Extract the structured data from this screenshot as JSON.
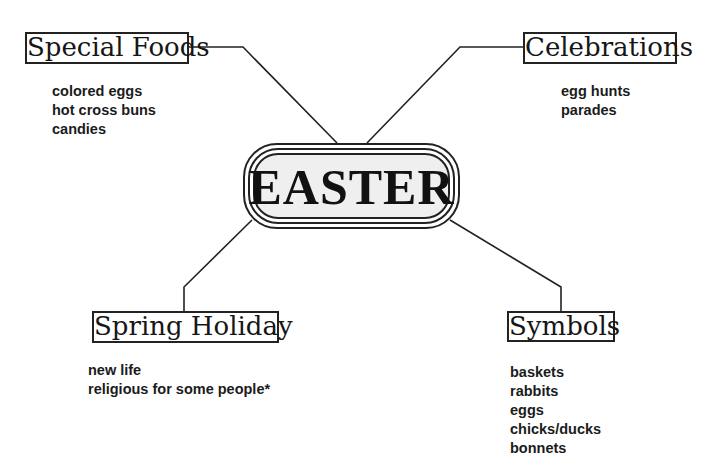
{
  "center": {
    "title": "EASTER"
  },
  "branches": [
    {
      "label": "Special Foods",
      "position": "top-left",
      "items": [
        "colored eggs",
        "hot cross buns",
        "candies"
      ]
    },
    {
      "label": "Celebrations",
      "position": "top-right",
      "items": [
        "egg hunts",
        "parades"
      ]
    },
    {
      "label": "Spring Holiday",
      "position": "bottom-left",
      "items": [
        "new life",
        "religious for some people*"
      ]
    },
    {
      "label": "Symbols",
      "position": "bottom-right",
      "items": [
        "baskets",
        "rabbits",
        "eggs",
        "chicks/ducks",
        "bonnets"
      ]
    }
  ],
  "colors": {
    "line": "#222222",
    "center_fill": "#efefef",
    "text": "#161616"
  }
}
